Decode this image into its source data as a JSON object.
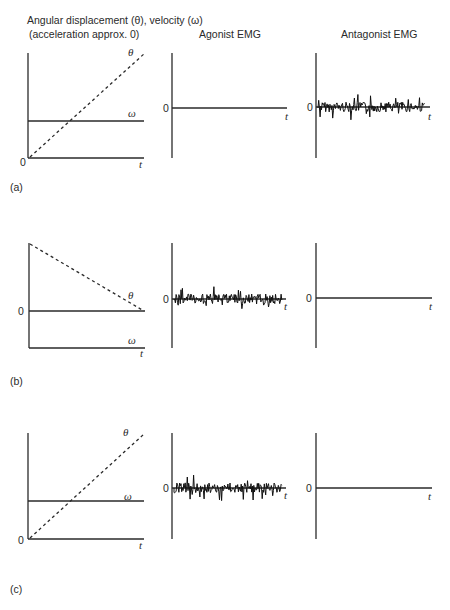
{
  "header": {
    "col1_line1": "Angular displacement (θ), velocity (ω)",
    "col1_line2": "(acceleration approx. 0)",
    "col2": "Agonist EMG",
    "col3": "Antagonist EMG"
  },
  "symbols": {
    "theta": "θ",
    "omega": "ω",
    "time": "t",
    "zero": "0"
  },
  "rows": [
    {
      "label": "(a)",
      "kinematics": "theta rises linearly from 0; omega constant positive",
      "agonist_emg": "silent (flat line at 0)",
      "antagonist_emg": "active (bursting signal)"
    },
    {
      "label": "(b)",
      "kinematics": "theta decreases linearly to 0; omega constant negative (below zero)",
      "agonist_emg": "active (bursting signal)",
      "antagonist_emg": "silent (flat line at 0)"
    },
    {
      "label": "(c)",
      "kinematics": "theta rises linearly from 0; omega constant positive",
      "agonist_emg": "active (bursting signal)",
      "antagonist_emg": "silent (flat line at 0)"
    }
  ],
  "colors": {
    "line": "#1a1a1a",
    "axis": "#333333",
    "background": "#ffffff"
  }
}
